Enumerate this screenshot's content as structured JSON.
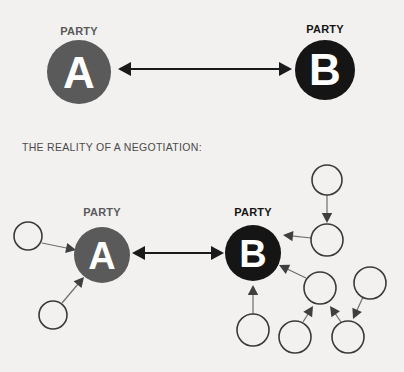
{
  "page": {
    "background_color": "#f2f1ef",
    "width": 404,
    "height": 372
  },
  "caption": {
    "text": "THE REALITY OF A NEGOTIATION:",
    "x": 22,
    "y": 151,
    "color": "#4a4a4a"
  },
  "colors": {
    "party_a_fill": "#5a5a5a",
    "party_b_fill": "#151515",
    "label_gray": "#5a5a5a",
    "label_black": "#151515",
    "letter_fill": "#ffffff",
    "satellite_stroke": "#3a3a3a",
    "satellite_fill": "#f2f1ef",
    "thin_arrow": "#6e6e6e",
    "main_arrow": "#1a1a1a"
  },
  "ideal_diagram": {
    "name": "ideal-negotiation",
    "party_a": {
      "label": "PARTY",
      "letter": "A",
      "cx": 79,
      "cy": 72,
      "r": 32,
      "fill": "#5a5a5a",
      "label_x": 79,
      "label_y": 35,
      "label_color": "#5a5a5a"
    },
    "party_b": {
      "label": "PARTY",
      "letter": "B",
      "cx": 325,
      "cy": 70,
      "r": 30,
      "fill": "#151515",
      "label_x": 325,
      "label_y": 33,
      "label_color": "#151515"
    },
    "connector": {
      "name": "bidirectional-arrow",
      "x1": 118,
      "x2": 292,
      "y": 69
    }
  },
  "reality_diagram": {
    "name": "reality-negotiation",
    "party_a": {
      "label": "PARTY",
      "letter": "A",
      "cx": 102,
      "cy": 255,
      "r": 28,
      "fill": "#5a5a5a",
      "label_x": 102,
      "label_y": 216,
      "label_color": "#5a5a5a"
    },
    "party_b": {
      "label": "PARTY",
      "letter": "B",
      "cx": 253,
      "cy": 253,
      "r": 28,
      "fill": "#151515",
      "label_x": 253,
      "label_y": 216,
      "label_color": "#151515"
    },
    "connector": {
      "name": "bidirectional-arrow",
      "x1": 132,
      "x2": 224,
      "y": 253
    },
    "stakeholders_a": [
      {
        "id": "a1",
        "cx": 28,
        "cy": 236,
        "r": 14
      },
      {
        "id": "a2",
        "cx": 53,
        "cy": 315,
        "r": 14
      }
    ],
    "stakeholders_b": [
      {
        "id": "b1",
        "cx": 327,
        "cy": 180,
        "r": 15
      },
      {
        "id": "b2",
        "cx": 327,
        "cy": 240,
        "r": 16
      },
      {
        "id": "b3",
        "cx": 320,
        "cy": 288,
        "r": 16
      },
      {
        "id": "b4",
        "cx": 370,
        "cy": 283,
        "r": 16
      },
      {
        "id": "b5",
        "cx": 253,
        "cy": 330,
        "r": 16
      },
      {
        "id": "b6",
        "cx": 295,
        "cy": 337,
        "r": 16
      },
      {
        "id": "b7",
        "cx": 348,
        "cy": 337,
        "r": 16
      }
    ],
    "influence_arrows": [
      {
        "id": "a1-to-a",
        "from": "a1",
        "to": "party-a",
        "x1": 42,
        "y1": 243,
        "x2": 76,
        "y2": 250
      },
      {
        "id": "a2-to-a",
        "from": "a2",
        "to": "party-a",
        "x1": 62,
        "y1": 303,
        "x2": 84,
        "y2": 277
      },
      {
        "id": "b1-to-b2",
        "from": "b1",
        "to": "b2",
        "x1": 327,
        "y1": 195,
        "x2": 327,
        "y2": 223
      },
      {
        "id": "b2-to-b",
        "from": "b2",
        "to": "party-b",
        "x1": 311,
        "y1": 238,
        "x2": 283,
        "y2": 235
      },
      {
        "id": "b3-to-b",
        "from": "b3",
        "to": "party-b",
        "x1": 306,
        "y1": 278,
        "x2": 279,
        "y2": 265
      },
      {
        "id": "b5-to-b",
        "from": "b5",
        "to": "party-b",
        "x1": 253,
        "y1": 314,
        "x2": 253,
        "y2": 285
      },
      {
        "id": "b6-to-b3",
        "from": "b6",
        "to": "b3",
        "x1": 303,
        "y1": 322,
        "x2": 313,
        "y2": 306
      },
      {
        "id": "b7-to-b3",
        "from": "b7",
        "to": "b3",
        "x1": 341,
        "y1": 322,
        "x2": 330,
        "y2": 306
      },
      {
        "id": "b4-to-b7",
        "from": "b4",
        "to": "b7",
        "x1": 363,
        "y1": 297,
        "x2": 353,
        "y2": 319
      }
    ]
  }
}
